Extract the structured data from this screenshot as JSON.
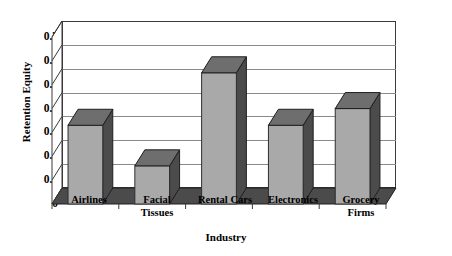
{
  "chart_data": {
    "type": "bar",
    "title": "",
    "xlabel": "Industry",
    "ylabel": "Retention Equity",
    "categories": [
      "Airlines",
      "Facial Tissues",
      "Rental Cars",
      "Electronics",
      "Grocery Firms"
    ],
    "category_lines": [
      [
        "Airlines"
      ],
      [
        "Facial",
        "Tissues"
      ],
      [
        "Rental Cars"
      ],
      [
        "Electronics"
      ],
      [
        "Grocery",
        "Firms"
      ]
    ],
    "values": [
      0.33,
      0.16,
      0.55,
      0.33,
      0.4
    ],
    "ylim": [
      0,
      0.7
    ],
    "yticks": [
      0,
      0.1,
      0.2,
      0.3,
      0.4,
      0.5,
      0.6,
      0.7
    ],
    "ytick_labels": [
      "0",
      "0.1",
      "0.2",
      "0.3",
      "0.4",
      "0.5",
      "0.6",
      "0.7"
    ],
    "grid": true,
    "legend": false,
    "style": "3d-column",
    "colors": {
      "bar_front": "#a9a9a9",
      "bar_side": "#4b4b4b",
      "bar_top": "#6e6e6e",
      "gridline": "#8a8a8a",
      "frame": "#3a3a3a",
      "background": "#ffffff",
      "text": "#000000"
    }
  }
}
